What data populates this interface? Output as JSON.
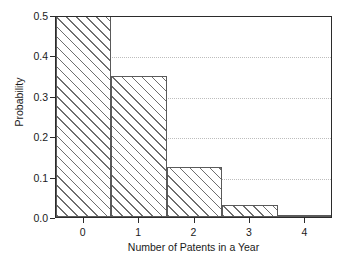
{
  "chart_data": {
    "type": "bar",
    "title": "",
    "subtitle": "",
    "xlabel": "Number of Patents in a Year",
    "ylabel": "Probability",
    "categories": [
      "0",
      "1",
      "2",
      "3",
      "4"
    ],
    "values": [
      0.5,
      0.35,
      0.125,
      0.03,
      0.005
    ],
    "xlim": [
      -0.5,
      4.5
    ],
    "ylim": [
      0.0,
      0.5
    ],
    "xticks": [
      "0",
      "1",
      "2",
      "3",
      "4"
    ],
    "yticks": [
      "0.0",
      "0.1",
      "0.2",
      "0.3",
      "0.4",
      "0.5"
    ],
    "ytick_values": [
      0.0,
      0.1,
      0.2,
      0.3,
      0.4,
      0.5
    ],
    "grid": "horizontal-dotted",
    "gridline_values": [
      0.1,
      0.2,
      0.3,
      0.4
    ],
    "legend": null,
    "legend_position": "none",
    "bar_style": "hatched-diagonal",
    "bar_width": 1.0,
    "annotations": [],
    "colors": {
      "axis": "#2b2b2b",
      "grid": "#bdbdbd",
      "bar_edge": "#5a5a5a",
      "bar_hatch": "#6e6e6e",
      "bar_fill": "#ffffff",
      "background": "#ffffff",
      "text": "#1a1a1a"
    }
  }
}
